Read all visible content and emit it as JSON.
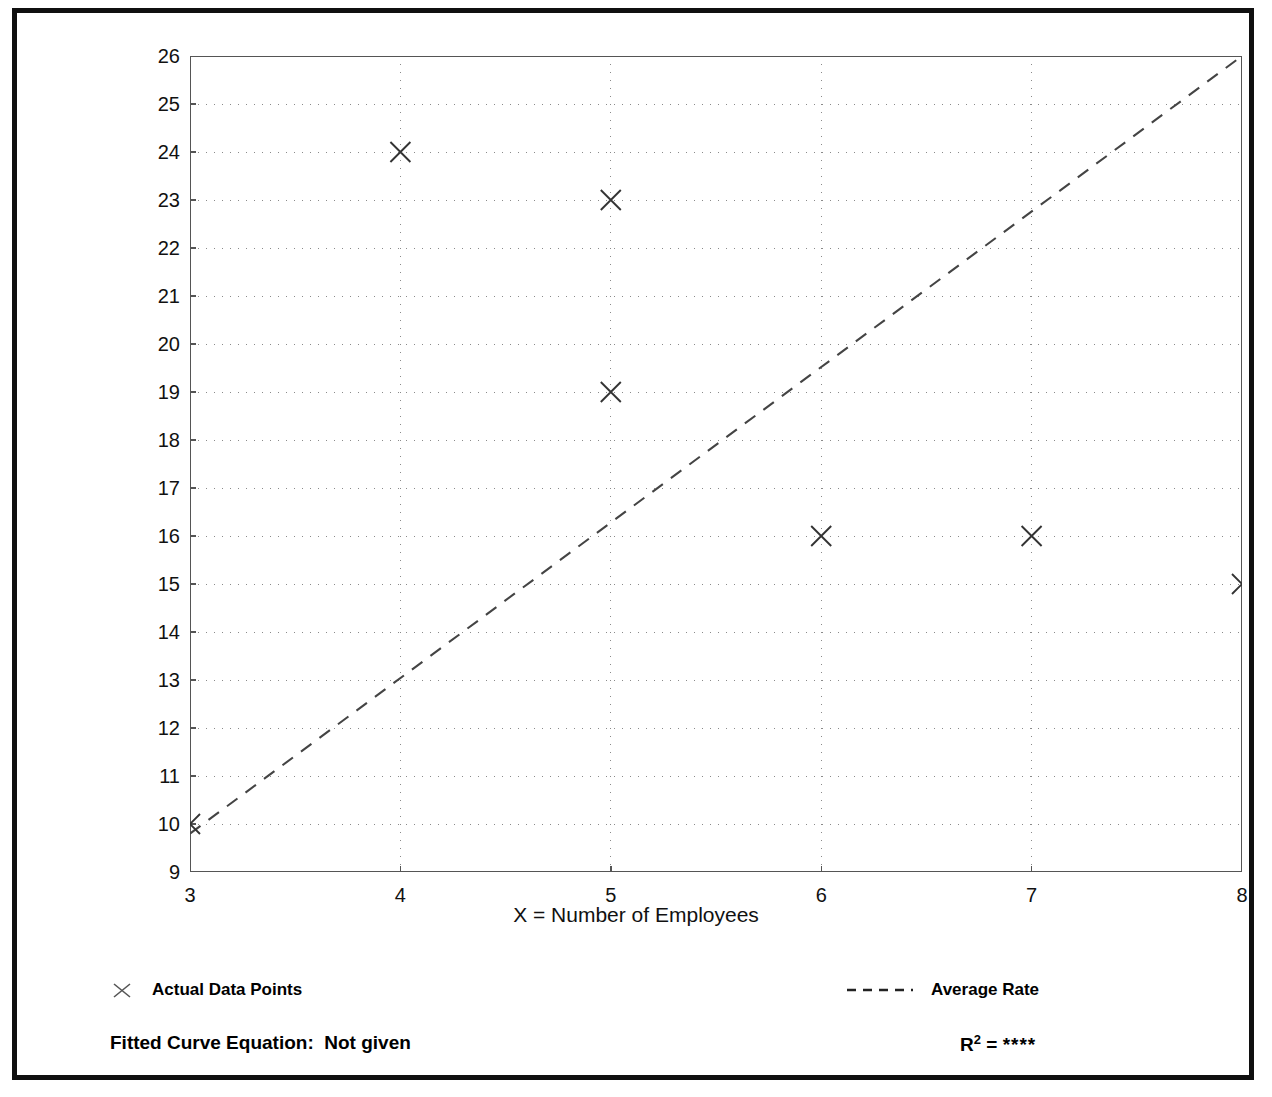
{
  "chart_data": {
    "type": "scatter",
    "title": "",
    "xlabel": "X = Number of Employees",
    "ylabel": "T = Average Vehicle Trip Ends",
    "xlim": [
      3,
      8
    ],
    "ylim": [
      9,
      26
    ],
    "xticks": [
      3,
      4,
      5,
      6,
      7,
      8
    ],
    "yticks": [
      9,
      10,
      11,
      12,
      13,
      14,
      15,
      16,
      17,
      18,
      19,
      20,
      21,
      22,
      23,
      24,
      25,
      26
    ],
    "minor_ticks": "halves on both axes",
    "grid": true,
    "grid_style": "dotted",
    "legend_position": "below plot",
    "series": [
      {
        "name": "Actual Data Points",
        "marker": "x",
        "points": [
          {
            "x": 3,
            "y": 10
          },
          {
            "x": 4,
            "y": 24
          },
          {
            "x": 5,
            "y": 23
          },
          {
            "x": 5,
            "y": 19
          },
          {
            "x": 6,
            "y": 16
          },
          {
            "x": 7,
            "y": 16
          },
          {
            "x": 8,
            "y": 15
          }
        ]
      },
      {
        "name": "Average Rate",
        "style": "dashed line",
        "line": [
          {
            "x": 3,
            "y": 9.8
          },
          {
            "x": 8,
            "y": 26
          }
        ]
      }
    ],
    "annotations": {
      "fitted_curve_equation": "Fitted Curve Equation:  Not given",
      "r_squared_label": "R",
      "r_squared_exponent": "2",
      "r_squared_equals": " = ",
      "r_squared_value": "****"
    }
  },
  "axes": {
    "y_title": "T = Average Vehicle Trip Ends",
    "x_title": "X = Number of Employees",
    "y_tick_labels": [
      "26",
      "25",
      "24",
      "23",
      "22",
      "21",
      "20",
      "19",
      "18",
      "17",
      "16",
      "15",
      "14",
      "13",
      "12",
      "11",
      "10",
      "9"
    ],
    "x_tick_labels": [
      "3",
      "4",
      "5",
      "6",
      "7",
      "8"
    ]
  },
  "legend": {
    "data_points_label": "Actual Data Points",
    "average_rate_label": "Average Rate"
  },
  "footer": {
    "fitted_equation": "Fitted Curve Equation:  Not given",
    "r_label": "R",
    "r_exponent": "2",
    "r_equals": " = ",
    "r_value": "****"
  },
  "colors": {
    "frame": "#101010",
    "axis": "#555555",
    "grid": "#8a8a8a",
    "marker": "#333333",
    "trend": "#444444",
    "background": "#ffffff"
  }
}
